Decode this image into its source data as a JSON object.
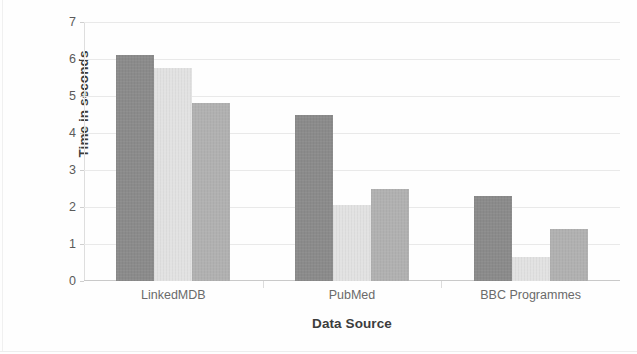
{
  "chart_data": {
    "type": "bar",
    "title": "",
    "subtitle": "",
    "xlabel": "Data Source",
    "ylabel": "Time in seconds",
    "categories": [
      "LinkedMDB",
      "PubMed",
      "BBC Programmes"
    ],
    "series": [
      {
        "name": "Series 1",
        "color": "#8b8b8b",
        "values": [
          6.1,
          4.5,
          2.3
        ]
      },
      {
        "name": "Series 2",
        "color": "#e2e2e2",
        "values": [
          5.75,
          2.05,
          0.65
        ]
      },
      {
        "name": "Series 3",
        "color": "#b1b1b1",
        "values": [
          4.8,
          2.5,
          1.4
        ]
      }
    ],
    "ylim": [
      0,
      7
    ],
    "ytick_labels": [
      "7",
      "6",
      "5",
      "4",
      "3",
      "2",
      "1",
      "0"
    ],
    "ytick_values": [
      7,
      6,
      5,
      4,
      3,
      2,
      1,
      0
    ],
    "grid": true,
    "grid_axis": "y",
    "legend": false,
    "legend_position": "none",
    "grouped": true,
    "background_color": "#fefefe",
    "gridline_color": "#e9e9e9",
    "axis_color": "#c9c9c9",
    "text_color": "#3c3c3c",
    "tick_text_color": "#5a5a5a"
  }
}
